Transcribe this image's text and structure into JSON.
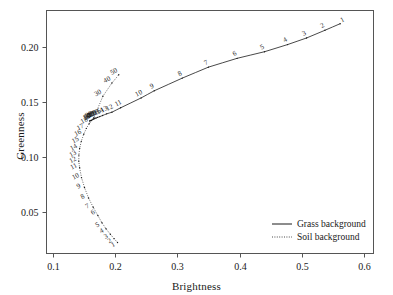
{
  "chart_data": {
    "type": "line",
    "title": "",
    "xlabel": "Brightness",
    "ylabel": "Greenness",
    "xlim": [
      0.09,
      0.615
    ],
    "ylim": [
      0.012,
      0.233
    ],
    "xticks": [
      0.1,
      0.2,
      0.3,
      0.4,
      0.5,
      0.6
    ],
    "xticklabels": [
      "0.1",
      "0.2",
      "0.3",
      "0.4",
      "0.5",
      "0.6"
    ],
    "yticks": [
      0.05,
      0.1,
      0.15,
      0.2
    ],
    "yticklabels": [
      "0.05",
      "0.10",
      "0.15",
      "0.20"
    ],
    "grid": false,
    "legend_position": "lower right",
    "series": [
      {
        "name": "Grass background",
        "style": "solid",
        "color": "#1a1a1a",
        "points": [
          {
            "label": "1",
            "x": 0.5615,
            "y": 0.221
          },
          {
            "label": "2",
            "x": 0.537,
            "y": 0.215
          },
          {
            "label": "3",
            "x": 0.5075,
            "y": 0.208
          },
          {
            "label": "4",
            "x": 0.477,
            "y": 0.202
          },
          {
            "label": "5",
            "x": 0.44,
            "y": 0.1955
          },
          {
            "label": "6",
            "x": 0.396,
            "y": 0.1895
          },
          {
            "label": "7",
            "x": 0.35,
            "y": 0.1815
          },
          {
            "label": "8",
            "x": 0.308,
            "y": 0.1715
          },
          {
            "label": "9",
            "x": 0.263,
            "y": 0.16
          },
          {
            "label": "10",
            "x": 0.242,
            "y": 0.1535
          },
          {
            "label": "11",
            "x": 0.209,
            "y": 0.1445
          },
          {
            "label": "12",
            "x": 0.195,
            "y": 0.1405
          },
          {
            "label": "13",
            "x": 0.1865,
            "y": 0.139
          },
          {
            "label": "14",
            "x": 0.18,
            "y": 0.1375
          },
          {
            "label": "15",
            "x": 0.1755,
            "y": 0.1365
          },
          {
            "label": "16",
            "x": 0.172,
            "y": 0.1358
          },
          {
            "label": "17",
            "x": 0.1695,
            "y": 0.1352
          },
          {
            "label": "18",
            "x": 0.1675,
            "y": 0.1348
          },
          {
            "label": "19",
            "x": 0.166,
            "y": 0.1344
          },
          {
            "label": "20",
            "x": 0.1648,
            "y": 0.1341
          },
          {
            "label": "30",
            "x": 0.1612,
            "y": 0.1331
          },
          {
            "label": "40",
            "x": 0.16,
            "y": 0.1327
          },
          {
            "label": "50",
            "x": 0.1594,
            "y": 0.1325
          }
        ]
      },
      {
        "name": "Soil background",
        "style": "dotted",
        "color": "#1a1a1a",
        "points": [
          {
            "label": "1",
            "x": 0.204,
            "y": 0.022
          },
          {
            "label": "2",
            "x": 0.1985,
            "y": 0.0255
          },
          {
            "label": "3",
            "x": 0.1925,
            "y": 0.0295
          },
          {
            "label": "4",
            "x": 0.1855,
            "y": 0.0345
          },
          {
            "label": "5",
            "x": 0.179,
            "y": 0.04
          },
          {
            "label": "6",
            "x": 0.1725,
            "y": 0.0465
          },
          {
            "label": "7",
            "x": 0.165,
            "y": 0.054
          },
          {
            "label": "8",
            "x": 0.1575,
            "y": 0.0625
          },
          {
            "label": "9",
            "x": 0.151,
            "y": 0.072
          },
          {
            "label": "10",
            "x": 0.1462,
            "y": 0.081
          },
          {
            "label": "11",
            "x": 0.1432,
            "y": 0.09
          },
          {
            "label": "12",
            "x": 0.1418,
            "y": 0.096
          },
          {
            "label": "13",
            "x": 0.142,
            "y": 0.1015
          },
          {
            "label": "14",
            "x": 0.1432,
            "y": 0.1075
          },
          {
            "label": "15",
            "x": 0.1458,
            "y": 0.114
          },
          {
            "label": "16",
            "x": 0.1498,
            "y": 0.1205
          },
          {
            "label": "17",
            "x": 0.154,
            "y": 0.1258
          },
          {
            "label": "18",
            "x": 0.1585,
            "y": 0.13
          },
          {
            "label": "19",
            "x": 0.1625,
            "y": 0.133
          },
          {
            "label": "20",
            "x": 0.166,
            "y": 0.1355
          },
          {
            "label": "30",
            "x": 0.1805,
            "y": 0.155
          },
          {
            "label": "40",
            "x": 0.195,
            "y": 0.167
          },
          {
            "label": "50",
            "x": 0.206,
            "y": 0.1745
          }
        ]
      }
    ],
    "legend": [
      {
        "label": "Grass background",
        "style": "solid"
      },
      {
        "label": "Soil background",
        "style": "dotted"
      }
    ]
  }
}
